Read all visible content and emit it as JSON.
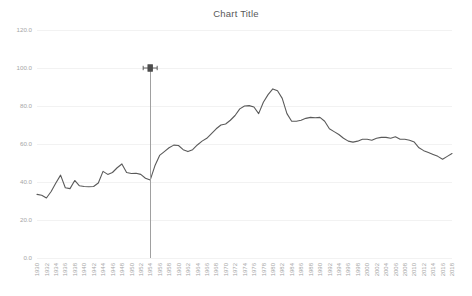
{
  "chart": {
    "title": "Chart Title"
  },
  "cursor": {
    "name": "horizontal-resize-cursor",
    "x_year": 1954,
    "y_value": 100.0
  },
  "chart_data": {
    "type": "line",
    "title": "Chart Title",
    "xlabel": "",
    "ylabel": "",
    "ylim": [
      0.0,
      120.0
    ],
    "ytick_labels": [
      "0.0",
      "20.0",
      "40.0",
      "60.0",
      "80.0",
      "100.0",
      "120.0"
    ],
    "ytick_values": [
      0.0,
      20.0,
      40.0,
      60.0,
      80.0,
      100.0,
      120.0
    ],
    "grid": true,
    "legend": false,
    "xtick_labels": [
      "1930",
      "1932",
      "1934",
      "1936",
      "1938",
      "1940",
      "1942",
      "1944",
      "1946",
      "1948",
      "1950",
      "1952",
      "1954",
      "1956",
      "1958",
      "1960",
      "1962",
      "1964",
      "1966",
      "1968",
      "1970",
      "1972",
      "1974",
      "1976",
      "1978",
      "1980",
      "1982",
      "1984",
      "1986",
      "1988",
      "1990",
      "1992",
      "1994",
      "1996",
      "1998",
      "2000",
      "2002",
      "2004",
      "2006",
      "2008",
      "2010",
      "2012",
      "2014",
      "2016",
      "2018"
    ],
    "x": [
      1930,
      1931,
      1932,
      1933,
      1934,
      1935,
      1936,
      1937,
      1938,
      1939,
      1940,
      1941,
      1942,
      1943,
      1944,
      1945,
      1946,
      1947,
      1948,
      1949,
      1950,
      1951,
      1952,
      1953,
      1954,
      1955,
      1956,
      1957,
      1958,
      1959,
      1960,
      1961,
      1962,
      1963,
      1964,
      1965,
      1966,
      1967,
      1968,
      1969,
      1970,
      1971,
      1972,
      1973,
      1974,
      1975,
      1976,
      1977,
      1978,
      1979,
      1980,
      1981,
      1982,
      1983,
      1984,
      1985,
      1986,
      1987,
      1988,
      1989,
      1990,
      1991,
      1992,
      1993,
      1994,
      1995,
      1996,
      1997,
      1998,
      1999,
      2000,
      2001,
      2002,
      2003,
      2004,
      2005,
      2006,
      2007,
      2008,
      2009,
      2010,
      2011,
      2012,
      2013,
      2014,
      2015,
      2016,
      2017,
      2018
    ],
    "values": [
      33.5,
      33.0,
      31.6,
      35.0,
      39.5,
      43.6,
      37.0,
      36.5,
      40.8,
      38.0,
      37.6,
      37.5,
      37.6,
      39.5,
      45.6,
      44.0,
      45.0,
      47.5,
      49.5,
      45.0,
      44.5,
      44.6,
      44.0,
      42.0,
      41.0,
      48.5,
      54.0,
      56.0,
      58.0,
      59.4,
      59.2,
      57.0,
      56.0,
      57.0,
      59.5,
      61.5,
      63.0,
      65.5,
      68.0,
      70.0,
      70.5,
      72.5,
      75.0,
      78.5,
      80.0,
      80.2,
      79.5,
      76.0,
      82.0,
      86.0,
      89.0,
      88.0,
      84.0,
      76.0,
      72.0,
      72.0,
      72.5,
      73.5,
      74.0,
      73.8,
      74.0,
      72.0,
      68.0,
      66.5,
      65.0,
      63.0,
      61.5,
      61.0,
      61.5,
      62.5,
      62.5,
      62.0,
      63.0,
      63.5,
      63.5,
      63.0,
      63.8,
      62.5,
      62.5,
      62.0,
      61.0,
      58.0,
      56.5,
      55.5,
      54.5,
      53.5,
      52.0,
      53.5,
      55.0
    ],
    "series_name": "Series 1",
    "colors": {
      "line": "#5a5a5a",
      "grid": "#f2f2f2",
      "tick_text": "#a6a6a6",
      "title_text": "#595959",
      "cursor_line": "#a0a0a0",
      "background": "#ffffff"
    }
  }
}
